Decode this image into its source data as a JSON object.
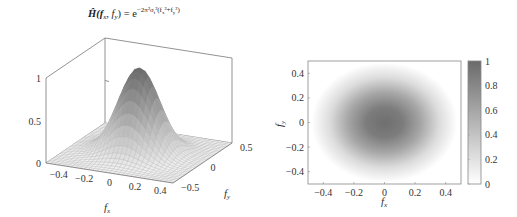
{
  "chart_data": [
    {
      "type": "surface3d",
      "title": "Ĥ(f_x, f_y) = e^{-2π²σ_t²(f_x²+f_y²)}",
      "title_parts": {
        "lhs": "Ĥ(f",
        "x": "x",
        "sep": ", f",
        "y": "y",
        "eq": ") = e",
        "exp": "−2π²σ",
        "t": "t",
        "exp2": "²(f",
        "x2": "x",
        "plus": "²+f",
        "y2": "y",
        "close": "²)"
      },
      "xlabel": "f_x",
      "ylabel": "f_y",
      "zlabel": "",
      "xlabel_main": "f",
      "xlabel_sub": "x",
      "ylabel_main": "f",
      "ylabel_sub": "y",
      "xlim": [
        -0.5,
        0.5
      ],
      "ylim": [
        -0.5,
        0.5
      ],
      "zlim": [
        0,
        1
      ],
      "x_ticks": [
        "−0.4",
        "−0.2",
        "0",
        "0.2",
        "0.4"
      ],
      "x_tick_values": [
        -0.4,
        -0.2,
        0,
        0.2,
        0.4
      ],
      "y_ticks": [
        "−0.5",
        "0",
        "0.5"
      ],
      "y_tick_values": [
        -0.5,
        0,
        0.5
      ],
      "z_ticks": [
        "0",
        "0.5",
        "1"
      ],
      "z_tick_values": [
        0,
        0.5,
        1
      ],
      "function": "exp(-(fx^2+fy^2)/(2*s^2))",
      "sigma_freq": 0.15,
      "peak_value": 1,
      "grid_resolution": 30,
      "colormap": "gray"
    },
    {
      "type": "heatmap",
      "xlabel": "f_x",
      "ylabel": "f_y",
      "xlabel_main": "f",
      "xlabel_sub": "x",
      "ylabel_main": "f",
      "ylabel_sub": "y",
      "xlim": [
        -0.5,
        0.5
      ],
      "ylim": [
        -0.5,
        0.5
      ],
      "x_ticks": [
        "−0.4",
        "−0.2",
        "0",
        "0.2",
        "0.4"
      ],
      "x_tick_values": [
        -0.4,
        -0.2,
        0,
        0.2,
        0.4
      ],
      "y_ticks": [
        "−0.4",
        "−0.2",
        "0",
        "0.2",
        "0.4"
      ],
      "y_tick_values": [
        -0.4,
        -0.2,
        0,
        0.2,
        0.4
      ],
      "sigma_freq": 0.15,
      "colorbar": {
        "range": [
          0,
          1
        ],
        "ticks": [
          "0",
          "0.2",
          "0.4",
          "0.6",
          "0.8",
          "1"
        ],
        "tick_values": [
          0,
          0.2,
          0.4,
          0.6,
          0.8,
          1
        ],
        "color_low": "#ffffff",
        "color_high": "#6a6a6a"
      }
    }
  ],
  "colors": {
    "axis": "#777777",
    "mesh": "#9a9a9a",
    "surface_low": "#f4f4f4",
    "surface_high": "#6a6a6a"
  }
}
